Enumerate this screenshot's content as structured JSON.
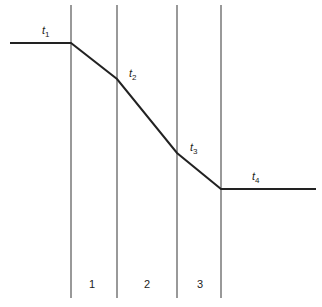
{
  "diagram": {
    "title": "",
    "boundaries_x": [
      71,
      117,
      177,
      221
    ],
    "profile_points": [
      [
        10,
        43
      ],
      [
        71,
        43
      ],
      [
        117,
        79
      ],
      [
        177,
        153
      ],
      [
        221,
        189
      ],
      [
        316,
        189
      ]
    ],
    "line_color": "#222222",
    "temperature_labels": [
      {
        "base": "t",
        "sub": "1"
      },
      {
        "base": "t",
        "sub": "2"
      },
      {
        "base": "t",
        "sub": "3"
      },
      {
        "base": "t",
        "sub": "4"
      }
    ],
    "zone_labels": [
      "1",
      "2",
      "3"
    ]
  }
}
